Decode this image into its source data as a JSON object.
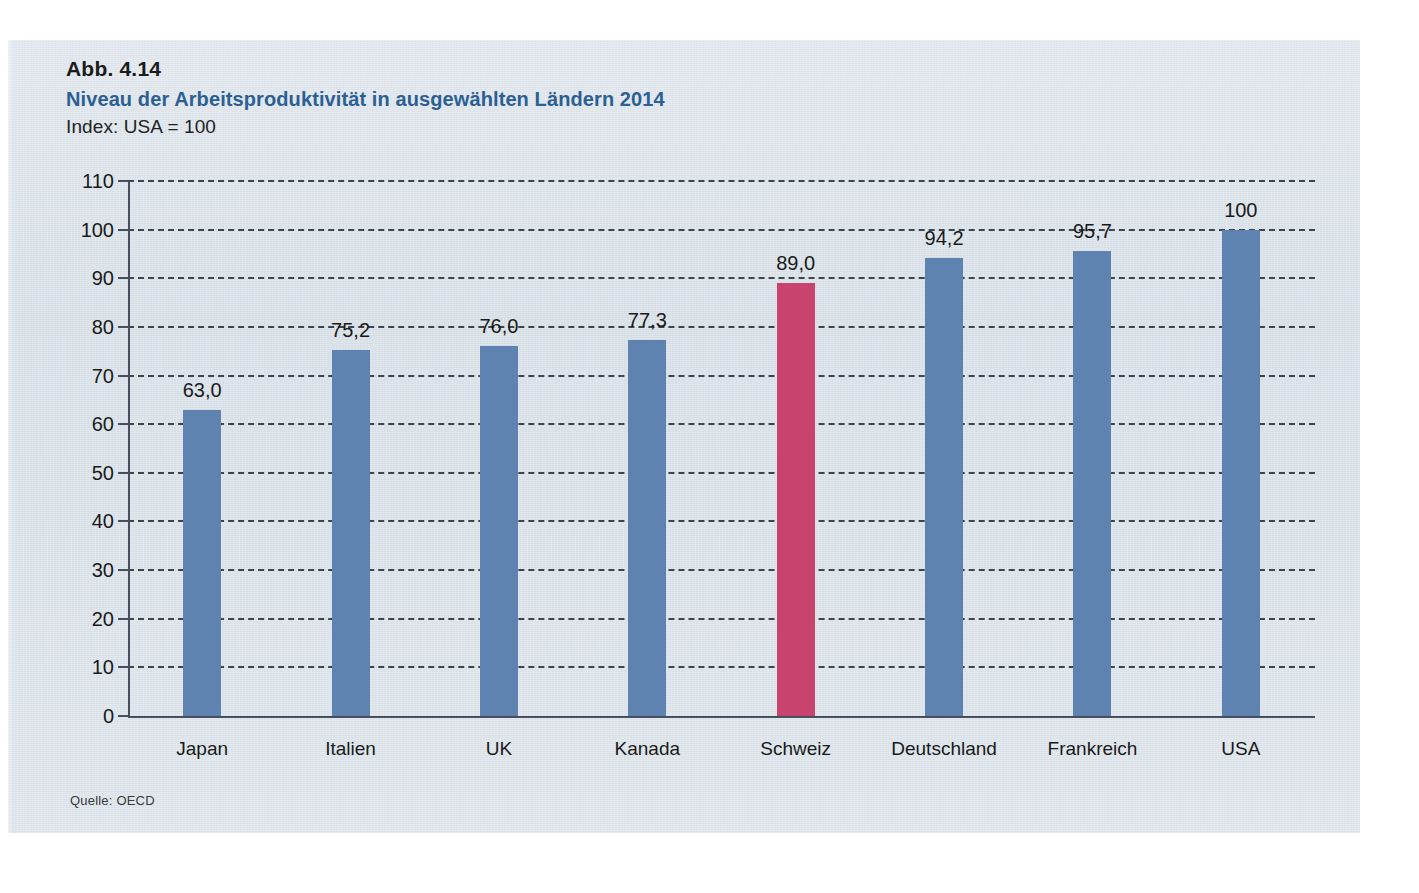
{
  "figure": {
    "number": "Abb. 4.14",
    "title": "Niveau der Arbeitsproduktivität in ausgewählten Ländern 2014",
    "subtitle": "Index: USA = 100",
    "source": "Quelle: OECD"
  },
  "colors": {
    "panel_background": "#d3dce4",
    "title_blue": "#2c5f92",
    "bar_blue": "#5f83b0",
    "bar_highlight_pink": "#c8446e",
    "axis": "#45505c",
    "grid": "#3c4450",
    "text": "#1a1a1a"
  },
  "chart_data": {
    "type": "bar",
    "title": "Niveau der Arbeitsproduktivität in ausgewählten Ländern 2014",
    "subtitle": "Index: USA = 100",
    "xlabel": "",
    "ylabel": "",
    "ylim": [
      0,
      110
    ],
    "ytick_step": 10,
    "yticks": [
      0,
      10,
      20,
      30,
      40,
      50,
      60,
      70,
      80,
      90,
      100,
      110
    ],
    "ytick_labels": [
      "0",
      "10",
      "20",
      "30",
      "40",
      "50",
      "60",
      "70",
      "80",
      "90",
      "100",
      "110"
    ],
    "grid": true,
    "grid_style": "dashed-horizontal",
    "legend": false,
    "categories": [
      "Japan",
      "Italien",
      "UK",
      "Kanada",
      "Schweiz",
      "Deutschland",
      "Frankreich",
      "USA"
    ],
    "values": [
      63.0,
      75.2,
      76.0,
      77.3,
      89.0,
      94.2,
      95.7,
      100
    ],
    "value_labels": [
      "63,0",
      "75,2",
      "76,0",
      "77,3",
      "89,0",
      "94,2",
      "95,7",
      "100"
    ],
    "highlight_index": 4,
    "bar_colors": [
      "#5f83b0",
      "#5f83b0",
      "#5f83b0",
      "#5f83b0",
      "#c8446e",
      "#5f83b0",
      "#5f83b0",
      "#5f83b0"
    ],
    "source": "Quelle: OECD"
  }
}
